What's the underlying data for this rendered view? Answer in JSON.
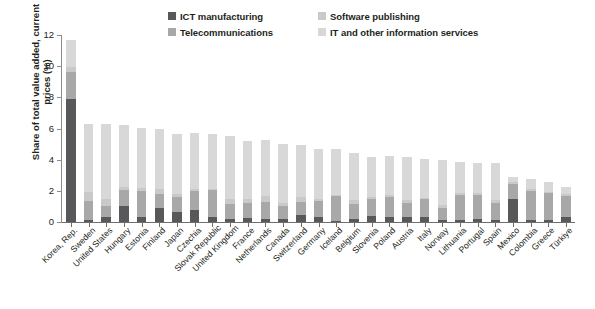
{
  "chart_data": {
    "type": "bar",
    "subtype": "stacked-vertical",
    "title": "",
    "xlabel": "",
    "ylabel": "Share of total value added, current prices (%)",
    "ylim": [
      0,
      12
    ],
    "yticks": [
      0,
      2,
      4,
      6,
      8,
      10,
      12
    ],
    "ytick_labels": [
      "0",
      "2",
      "4",
      "6",
      "8",
      "10",
      "12"
    ],
    "grid": false,
    "legend_position": "top-center",
    "categories": [
      "Korea, Rep.",
      "Sweden",
      "United States",
      "Hungary",
      "Estonia",
      "Finland",
      "Japan",
      "Czechia",
      "Slovak Republic",
      "United Kingdom",
      "France",
      "Netherlands",
      "Canada",
      "Switzerland",
      "Germany",
      "Iceland",
      "Belgium",
      "Slovenia",
      "Poland",
      "Austria",
      "Italy",
      "Norway",
      "Lithuania",
      "Portugal",
      "Spain",
      "Mexico",
      "Colombia",
      "Greece",
      "Türkiye"
    ],
    "series": [
      {
        "name": "ICT manufacturing",
        "color": "#58585a",
        "values": [
          7.9,
          0.15,
          0.3,
          1.05,
          0.35,
          0.9,
          0.65,
          0.75,
          0.35,
          0.2,
          0.25,
          0.2,
          0.2,
          0.45,
          0.35,
          0.05,
          0.2,
          0.4,
          0.3,
          0.35,
          0.3,
          0.1,
          0.15,
          0.2,
          0.15,
          1.45,
          0.1,
          0.1,
          0.35
        ]
      },
      {
        "name": "Telecommunications",
        "color": "#a8a8a8",
        "values": [
          1.7,
          1.2,
          0.75,
          1.0,
          1.65,
          0.9,
          0.95,
          1.25,
          1.7,
          0.95,
          1.0,
          1.1,
          0.85,
          0.85,
          1.0,
          1.6,
          0.95,
          1.1,
          1.3,
          0.85,
          1.15,
          0.8,
          1.6,
          1.55,
          1.1,
          1.0,
          1.9,
          1.75,
          1.35
        ]
      },
      {
        "name": "Software publishing",
        "color": "#c9c9c9",
        "values": [
          0.35,
          0.55,
          0.45,
          0.2,
          0.2,
          0.35,
          0.2,
          0.15,
          0.1,
          0.35,
          0.2,
          0.4,
          0.2,
          0.3,
          0.15,
          0.1,
          0.25,
          0.1,
          0.15,
          0.2,
          0.1,
          0.2,
          0.1,
          0.1,
          0.15,
          0.1,
          0.1,
          0.1,
          0.1
        ]
      },
      {
        "name": "IT and other information services",
        "color": "#d8d8d8",
        "values": [
          1.75,
          4.4,
          4.8,
          3.95,
          3.85,
          3.85,
          3.85,
          3.55,
          3.5,
          4.0,
          3.75,
          3.55,
          3.75,
          3.35,
          3.2,
          2.95,
          3.0,
          2.6,
          2.5,
          2.75,
          2.5,
          2.9,
          2.0,
          1.95,
          2.4,
          0.35,
          0.65,
          0.65,
          0.45
        ]
      }
    ]
  },
  "legend": {
    "entries": [
      {
        "label": "ICT manufacturing",
        "color": "#58585a",
        "row": 0,
        "col": 0
      },
      {
        "label": "Software publishing",
        "color": "#c9c9c9",
        "row": 0,
        "col": 1
      },
      {
        "label": "Telecommunications",
        "color": "#a8a8a8",
        "row": 1,
        "col": 0
      },
      {
        "label": "IT and other information services",
        "color": "#d8d8d8",
        "row": 1,
        "col": 1
      }
    ]
  }
}
